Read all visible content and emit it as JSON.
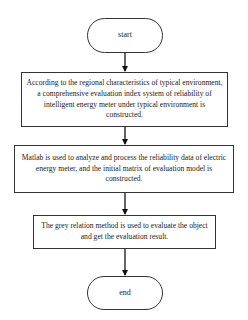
{
  "diagram": {
    "type": "flowchart",
    "nodes": [
      {
        "id": "start",
        "shape": "terminator",
        "label": "start"
      },
      {
        "id": "step1",
        "shape": "process",
        "label": "According to the regional characteristics of typical environment, a comprehensive evaluation index system of reliability of intelligent energy meter under typical environment is constructed."
      },
      {
        "id": "step2",
        "shape": "process",
        "label": "Matlab is used to analyze and process the reliability data of electric energy meter, and the initial matrix of evaluation model is constructed."
      },
      {
        "id": "step3",
        "shape": "process",
        "label": "The grey relation method is used to evaluate the object and get the evaluation result."
      },
      {
        "id": "end",
        "shape": "terminator",
        "label": "end"
      }
    ],
    "edges": [
      {
        "from": "start",
        "to": "step1"
      },
      {
        "from": "step1",
        "to": "step2"
      },
      {
        "from": "step2",
        "to": "step3"
      },
      {
        "from": "step3",
        "to": "end"
      }
    ]
  }
}
